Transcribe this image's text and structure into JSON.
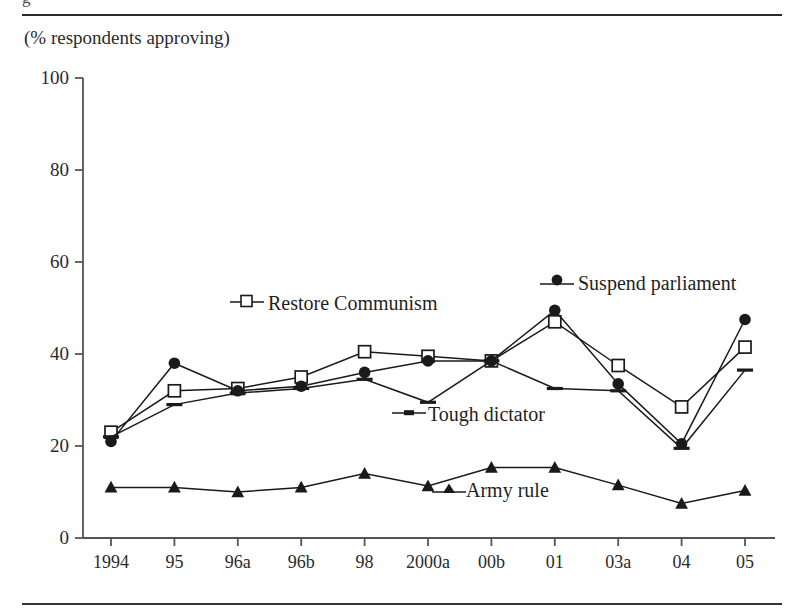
{
  "figure": {
    "clipped_caption_fragment": "g",
    "axis_caption": "(% respondents approving)"
  },
  "chart_data": {
    "type": "line",
    "title": "",
    "subtitle": "",
    "xlabel": "",
    "ylabel": "(% respondents approving)",
    "categories": [
      "1994",
      "95",
      "96a",
      "96b",
      "98",
      "2000a",
      "00b",
      "01",
      "03a",
      "04",
      "05"
    ],
    "ylim": [
      0,
      100
    ],
    "yticks": [
      0,
      20,
      40,
      60,
      80,
      100
    ],
    "grid": false,
    "legend_position": "inline-annotations",
    "series": [
      {
        "name": "Restore Communism",
        "marker": "open-square",
        "color": "#1a1a1a",
        "values": [
          23,
          32,
          32.5,
          35,
          40.5,
          39.5,
          38.5,
          47,
          37.5,
          28.5,
          41.5
        ]
      },
      {
        "name": "Suspend parliament",
        "marker": "filled-circle",
        "color": "#1a1a1a",
        "values": [
          21,
          38,
          32,
          33,
          36,
          38.5,
          38.5,
          49.5,
          33.5,
          20.5,
          47.5
        ]
      },
      {
        "name": "Tough dictator",
        "marker": "dash",
        "color": "#1a1a1a",
        "values": [
          22,
          29,
          31.5,
          32.5,
          34.5,
          29.5,
          38.5,
          32.5,
          32,
          19.5,
          36.5
        ]
      },
      {
        "name": "Army rule",
        "marker": "filled-triangle",
        "color": "#1a1a1a",
        "values": [
          11,
          11,
          10,
          11,
          14,
          11.3,
          15.3,
          15.3,
          11.5,
          7.5,
          10.3
        ]
      }
    ]
  }
}
